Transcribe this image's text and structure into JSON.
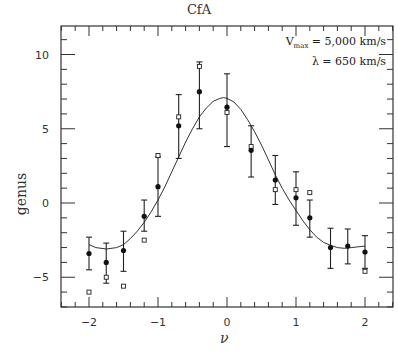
{
  "chart_data": {
    "type": "scatter",
    "title": "CfA",
    "xlabel": "ν",
    "ylabel": "genus",
    "xlim": [
      -2.4,
      2.4
    ],
    "ylim": [
      -7,
      11.9
    ],
    "xticks": [
      -2,
      -1,
      0,
      1,
      2
    ],
    "yticks": [
      -5,
      0,
      5,
      10
    ],
    "grid": false,
    "annotations": [
      "V_max = 5,000 km/s",
      "λ = 650 km/s"
    ],
    "series": [
      {
        "name": "filled circles (mean with error bars)",
        "marker": "filled-circle",
        "x": [
          -2.0,
          -1.75,
          -1.5,
          -1.2,
          -1.0,
          -0.7,
          -0.4,
          0.0,
          0.35,
          0.7,
          1.0,
          1.2,
          1.5,
          1.75,
          2.0
        ],
        "y": [
          -3.4,
          -4.0,
          -3.2,
          -0.9,
          1.1,
          5.2,
          7.5,
          6.45,
          3.55,
          1.55,
          0.35,
          -1.0,
          -3.0,
          -2.9,
          -3.3
        ],
        "err_low": [
          -4.5,
          -5.4,
          -4.6,
          -1.9,
          -0.9,
          3.0,
          5.0,
          3.8,
          1.75,
          -0.1,
          -1.5,
          -2.3,
          -4.4,
          -4.1,
          -4.4
        ],
        "err_high": [
          -2.3,
          -2.7,
          -1.9,
          0.2,
          3.1,
          7.3,
          9.5,
          8.7,
          5.2,
          3.2,
          2.1,
          0.2,
          -1.7,
          -1.75,
          -2.2
        ]
      },
      {
        "name": "open squares",
        "marker": "open-square",
        "x": [
          -2.0,
          -1.75,
          -1.5,
          -1.2,
          -1.0,
          -0.7,
          -0.4,
          0.0,
          0.35,
          0.7,
          1.0,
          1.2,
          2.0
        ],
        "y": [
          -6.0,
          -5.0,
          -5.6,
          -2.5,
          3.2,
          5.8,
          9.2,
          6.1,
          3.8,
          0.9,
          0.9,
          0.7,
          -4.6
        ]
      },
      {
        "name": "model curve",
        "marker": "line",
        "x": [
          -2.0,
          -1.9,
          -1.75,
          -1.6,
          -1.5,
          -1.4,
          -1.3,
          -1.2,
          -1.1,
          -1.0,
          -0.9,
          -0.8,
          -0.7,
          -0.6,
          -0.5,
          -0.4,
          -0.3,
          -0.2,
          -0.1,
          -0.05,
          0.0,
          0.1,
          0.2,
          0.3,
          0.4,
          0.5,
          0.6,
          0.7,
          0.8,
          0.9,
          1.0,
          1.1,
          1.2,
          1.3,
          1.4,
          1.5,
          1.6,
          1.7,
          1.8,
          1.9,
          2.0
        ],
        "y": [
          -2.8,
          -3.0,
          -3.1,
          -3.0,
          -2.8,
          -2.4,
          -1.9,
          -1.3,
          -0.6,
          0.2,
          1.1,
          2.1,
          3.1,
          4.1,
          5.0,
          5.8,
          6.4,
          6.85,
          7.05,
          7.1,
          7.05,
          6.8,
          6.3,
          5.6,
          4.8,
          3.9,
          2.9,
          1.9,
          1.0,
          0.2,
          -0.5,
          -1.2,
          -1.8,
          -2.3,
          -2.65,
          -2.85,
          -3.0,
          -3.05,
          -3.0,
          -2.95,
          -2.9
        ]
      }
    ]
  },
  "labels": {
    "title": "CfA",
    "xlabel": "ν",
    "ylabel": "genus",
    "legend_line1_prefix": "V",
    "legend_line1_sub": "max",
    "legend_line1_rest": " = 5,000 km/s",
    "legend_line2": "λ = 650 km/s"
  }
}
